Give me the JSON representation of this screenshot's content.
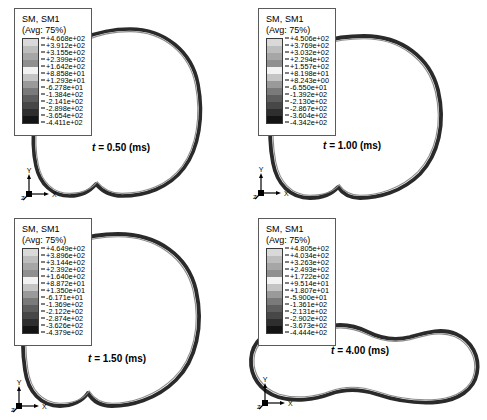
{
  "figure": {
    "background": "#ffffff",
    "width": 487,
    "height": 420,
    "panel_count": 4
  },
  "legend_common": {
    "title": "SM, SM1",
    "subtitle": "(Avg: 75%)",
    "swatch_count": 12,
    "colors": [
      "#d9d9d9",
      "#bdbdbd",
      "#a6a6a6",
      "#8f8f8f",
      "#f2f2f2",
      "#c4c4c4",
      "#9a9a9a",
      "#7a7a7a",
      "#5e5e5e",
      "#474747",
      "#2e2e2e",
      "#141414"
    ]
  },
  "axis_triad": {
    "y_label": "Y",
    "x_label": "X",
    "z_label": "Z"
  },
  "panels": [
    {
      "id": "panel-t-0-50",
      "time_label_prefix": "t",
      "time_label_value": "= 0.50 (ms)",
      "time_label_full": "t = 0.50 (ms)",
      "legend_values": [
        "+4.668e+02",
        "+3.912e+02",
        "+3.155e+02",
        "+2.399e+02",
        "+1.642e+02",
        "+8.858e+01",
        "+1.293e+01",
        "-6.278e+01",
        "-1.384e+02",
        "-2.141e+02",
        "-2.898e+02",
        "-3.654e+02",
        "-4.411e+02"
      ],
      "shape_name": "near-circular-ring"
    },
    {
      "id": "panel-t-1-00",
      "time_label_prefix": "t",
      "time_label_value": "= 1.00 (ms)",
      "time_label_full": "t = 1.00 (ms)",
      "legend_values": [
        "+4.506e+02",
        "+3.769e+02",
        "+3.032e+02",
        "+2.294e+02",
        "+1.557e+02",
        "+8.198e+01",
        "+8.243e+00",
        "-6.550e+01",
        "-1.392e+02",
        "-2.130e+02",
        "-2.867e+02",
        "-3.604e+02",
        "-4.342e+02"
      ],
      "shape_name": "rounded-ring-bottom-dimple"
    },
    {
      "id": "panel-t-1-50",
      "time_label_prefix": "t",
      "time_label_value": "= 1.50 (ms)",
      "time_label_full": "t = 1.50 (ms)",
      "legend_values": [
        "+4.649e+02",
        "+3.896e+02",
        "+3.144e+02",
        "+2.392e+02",
        "+1.640e+02",
        "+8.872e+01",
        "+1.350e+01",
        "-6.171e+01",
        "-1.369e+02",
        "-2.122e+02",
        "-2.874e+02",
        "-3.626e+02",
        "-4.379e+02"
      ],
      "shape_name": "rounded-ring-bottom-dimple-wide"
    },
    {
      "id": "panel-t-4-00",
      "time_label_prefix": "t",
      "time_label_value": "= 4.00 (ms)",
      "time_label_full": "t = 4.00 (ms)",
      "legend_values": [
        "+4.805e+02",
        "+4.034e+02",
        "+3.263e+02",
        "+2.493e+02",
        "+1.722e+02",
        "+9.514e+01",
        "+1.807e+01",
        "-5.900e+01",
        "-1.361e+02",
        "-2.131e+02",
        "-2.902e+02",
        "-3.673e+02",
        "-4.444e+02"
      ],
      "shape_name": "flattened-peanut-ring"
    }
  ],
  "chart_data": {
    "type": "contour",
    "title": "SM, SM1",
    "subtitle": "(Avg: 75%)",
    "field": "SM, SM1",
    "averaging": "75%",
    "units_note": "Section moment contour on deforming ring cross-section",
    "time_series": [
      {
        "time": 0.5,
        "time_units": "ms",
        "legend_max": 466.8,
        "legend_min": -441.1,
        "legend_levels": [
          466.8,
          391.2,
          315.5,
          239.9,
          164.2,
          88.58,
          12.93,
          -62.78,
          -138.4,
          -214.1,
          -289.8,
          -365.4,
          -441.1
        ]
      },
      {
        "time": 1.0,
        "time_units": "ms",
        "legend_max": 450.6,
        "legend_min": -434.2,
        "legend_levels": [
          450.6,
          376.9,
          303.2,
          229.4,
          155.7,
          81.98,
          8.243,
          -65.5,
          -139.2,
          -213.0,
          -286.7,
          -360.4,
          -434.2
        ]
      },
      {
        "time": 1.5,
        "time_units": "ms",
        "legend_max": 464.9,
        "legend_min": -437.9,
        "legend_levels": [
          464.9,
          389.6,
          314.4,
          239.2,
          164.0,
          88.72,
          13.5,
          -61.71,
          -136.9,
          -212.2,
          -287.4,
          -362.6,
          -437.9
        ]
      },
      {
        "time": 4.0,
        "time_units": "ms",
        "legend_max": 480.5,
        "legend_min": -444.4,
        "legend_levels": [
          480.5,
          403.4,
          326.3,
          249.3,
          172.2,
          95.14,
          18.07,
          -59.0,
          -136.1,
          -213.1,
          -290.2,
          -367.3,
          -444.4
        ]
      }
    ]
  }
}
